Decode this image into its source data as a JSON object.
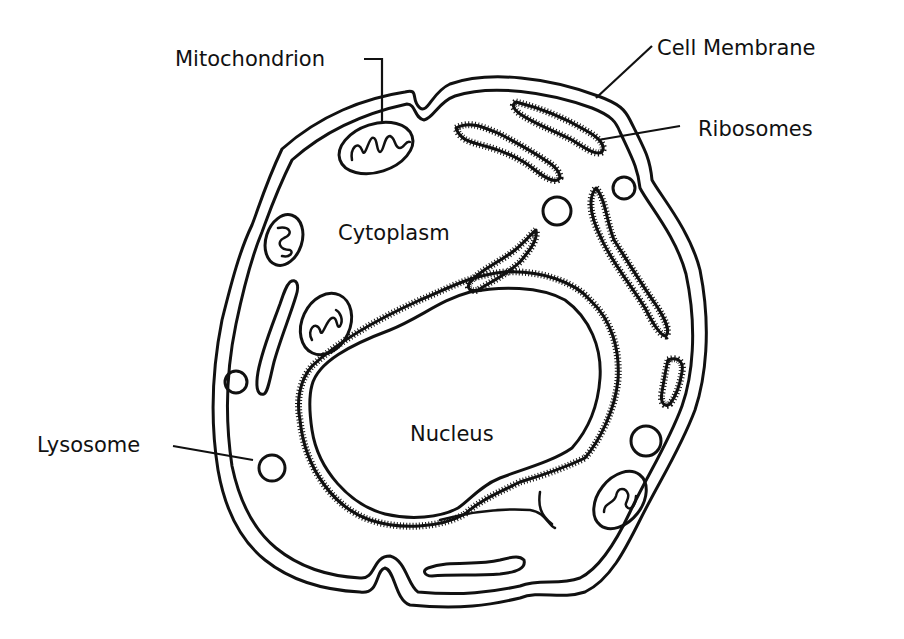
{
  "diagram": {
    "type": "labeled biological diagram",
    "colors": {
      "ink": "#111111",
      "background": "#ffffff"
    },
    "labels": {
      "mitochondrion": "Mitochondrion",
      "cell_membrane": "Cell Membrane",
      "ribosomes": "Ribosomes",
      "cytoplasm": "Cytoplasm",
      "lysosome": "Lysosome",
      "nucleus": "Nucleus"
    },
    "structures": [
      {
        "name": "cell-membrane",
        "count": 1
      },
      {
        "name": "nucleus",
        "count": 1
      },
      {
        "name": "mitochondrion",
        "count": 4
      },
      {
        "name": "lysosome",
        "count": 6
      },
      {
        "name": "rough-endoplasmic-reticulum",
        "count": 5
      },
      {
        "name": "smooth-endoplasmic-reticulum",
        "count": 2
      }
    ]
  }
}
